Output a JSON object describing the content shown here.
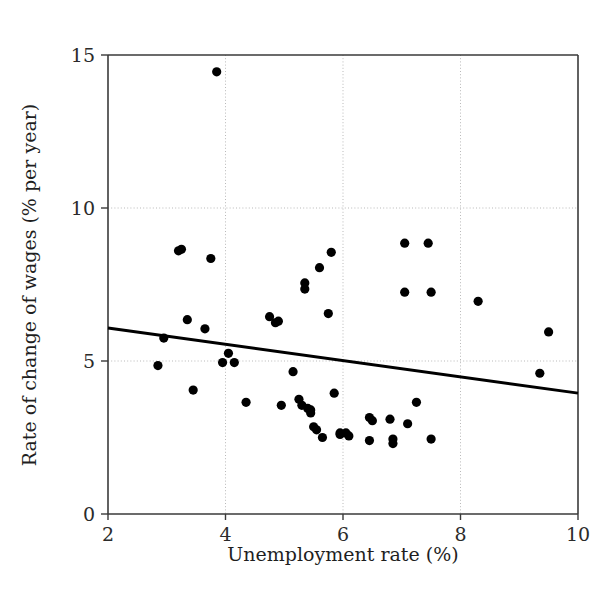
{
  "chart_data": {
    "type": "scatter",
    "title": "",
    "xlabel": "Unemployment rate (%)",
    "ylabel": "Rate of change of wages (% per year)",
    "xlim": [
      2,
      10
    ],
    "ylim": [
      0,
      15
    ],
    "xticks": [
      2,
      4,
      6,
      8,
      10
    ],
    "yticks": [
      0,
      5,
      10,
      15
    ],
    "xtick_labels": [
      "2",
      "4",
      "6",
      "8",
      "10"
    ],
    "ytick_labels": [
      "0",
      "5",
      "10",
      "15"
    ],
    "grid": "dotted gridlines at y = 5, y = 10 and x = 4, x = 6, x = 8",
    "legend": "none",
    "marker": "filled black circle",
    "marker_color": "#000000",
    "point_count": 52,
    "points": [
      {
        "x": 2.85,
        "y": 4.85
      },
      {
        "x": 2.95,
        "y": 5.75
      },
      {
        "x": 3.25,
        "y": 8.65
      },
      {
        "x": 3.35,
        "y": 6.35
      },
      {
        "x": 3.45,
        "y": 4.05
      },
      {
        "x": 3.65,
        "y": 6.05
      },
      {
        "x": 3.75,
        "y": 8.35
      },
      {
        "x": 3.85,
        "y": 14.45
      },
      {
        "x": 3.95,
        "y": 4.95
      },
      {
        "x": 4.05,
        "y": 5.25
      },
      {
        "x": 4.15,
        "y": 4.95
      },
      {
        "x": 4.35,
        "y": 3.65
      },
      {
        "x": 4.75,
        "y": 6.45
      },
      {
        "x": 4.85,
        "y": 6.25
      },
      {
        "x": 4.95,
        "y": 3.55
      },
      {
        "x": 5.15,
        "y": 4.65
      },
      {
        "x": 5.25,
        "y": 3.75
      },
      {
        "x": 5.3,
        "y": 3.55
      },
      {
        "x": 5.35,
        "y": 7.55
      },
      {
        "x": 5.35,
        "y": 7.35
      },
      {
        "x": 5.4,
        "y": 3.45
      },
      {
        "x": 5.45,
        "y": 3.3
      },
      {
        "x": 5.5,
        "y": 2.85
      },
      {
        "x": 5.55,
        "y": 2.75
      },
      {
        "x": 5.6,
        "y": 8.05
      },
      {
        "x": 5.65,
        "y": 2.5
      },
      {
        "x": 5.75,
        "y": 6.55
      },
      {
        "x": 5.8,
        "y": 8.55
      },
      {
        "x": 5.85,
        "y": 3.95
      },
      {
        "x": 5.95,
        "y": 2.65
      },
      {
        "x": 6.05,
        "y": 2.65
      },
      {
        "x": 6.1,
        "y": 2.55
      },
      {
        "x": 6.45,
        "y": 3.15
      },
      {
        "x": 6.45,
        "y": 2.4
      },
      {
        "x": 6.8,
        "y": 3.1
      },
      {
        "x": 6.85,
        "y": 2.45
      },
      {
        "x": 6.85,
        "y": 2.3
      },
      {
        "x": 7.05,
        "y": 8.85
      },
      {
        "x": 7.05,
        "y": 7.25
      },
      {
        "x": 7.1,
        "y": 2.95
      },
      {
        "x": 7.25,
        "y": 3.65
      },
      {
        "x": 7.45,
        "y": 8.85
      },
      {
        "x": 7.5,
        "y": 7.25
      },
      {
        "x": 7.5,
        "y": 2.45
      },
      {
        "x": 8.3,
        "y": 6.95
      },
      {
        "x": 9.35,
        "y": 4.6
      },
      {
        "x": 9.5,
        "y": 5.95
      },
      {
        "x": 3.2,
        "y": 8.6
      },
      {
        "x": 4.9,
        "y": 6.3
      },
      {
        "x": 5.45,
        "y": 3.4
      },
      {
        "x": 5.95,
        "y": 2.6
      },
      {
        "x": 6.5,
        "y": 3.05
      }
    ],
    "fit_line": {
      "label": "regression line",
      "x_start": 2,
      "y_start": 6.08,
      "x_end": 10,
      "y_end": 3.95,
      "color": "#000000"
    }
  }
}
